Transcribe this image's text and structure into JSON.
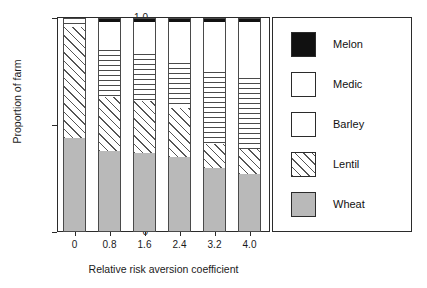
{
  "chart_data": {
    "type": "bar",
    "subtype": "stacked-bar",
    "title": "",
    "xlabel": "Relative risk aversion coefficient",
    "ylabel": "Proportion of farm",
    "categories": [
      "0",
      "0.8",
      "1.6",
      "2.4",
      "3.2",
      "4.0"
    ],
    "x_tick_labels": [
      "0",
      "0.8",
      "1.6",
      "2.4",
      "3.2",
      "4.0"
    ],
    "y_tick_labels": [
      "0",
      "0.5",
      "1.0"
    ],
    "y_ticks": [
      0,
      0.5,
      1.0
    ],
    "ylim": [
      0,
      1.0
    ],
    "grid": false,
    "legend_position": "right",
    "stack_order_bottom_to_top": [
      "Wheat",
      "Lentil",
      "Barley",
      "Medic",
      "Melon"
    ],
    "series": [
      {
        "name": "Wheat",
        "fill": "solid-gray",
        "color": "#b9b9b9",
        "values": [
          0.44,
          0.38,
          0.37,
          0.35,
          0.3,
          0.27
        ]
      },
      {
        "name": "Lentil",
        "fill": "diagonal-hatch",
        "color": "#ffffff",
        "values": [
          0.52,
          0.25,
          0.24,
          0.23,
          0.11,
          0.12
        ]
      },
      {
        "name": "Barley",
        "fill": "horizontal-lines",
        "color": "#ffffff",
        "values": [
          0.04,
          0.22,
          0.22,
          0.21,
          0.34,
          0.33
        ]
      },
      {
        "name": "Medic",
        "fill": "white",
        "color": "#ffffff",
        "values": [
          0.0,
          0.13,
          0.15,
          0.19,
          0.23,
          0.26
        ]
      },
      {
        "name": "Melon",
        "fill": "solid-black",
        "color": "#111111",
        "values": [
          0.0,
          0.02,
          0.02,
          0.02,
          0.02,
          0.02
        ]
      }
    ]
  },
  "legend": {
    "entries": [
      {
        "label": "Melon",
        "swatch": "solid-black"
      },
      {
        "label": "Medic",
        "swatch": "white"
      },
      {
        "label": "Barley",
        "swatch": "white"
      },
      {
        "label": "Lentil",
        "swatch": "diagonal-hatch"
      },
      {
        "label": "Wheat",
        "swatch": "solid-gray"
      }
    ]
  },
  "colors": {
    "axis": "#2b2b2b",
    "wheat": "#b9b9b9",
    "melon": "#111111",
    "hatch": "#555555",
    "background": "#ffffff"
  }
}
